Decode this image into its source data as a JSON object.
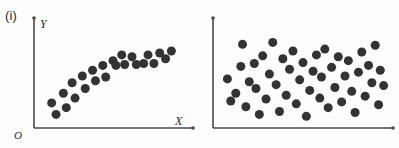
{
  "figure": {
    "background_color": "#fdfdfd",
    "dot_color": "#333333",
    "axis_color": "#4a4a4a"
  },
  "panels": [
    {
      "id": "i",
      "label": "(i)",
      "y_axis_label": "Y",
      "x_axis_label": "X",
      "origin_label": "O"
    },
    {
      "id": "ii",
      "label": "(ii)",
      "y_axis_label": "Y",
      "x_axis_label": "X",
      "origin_label": "O"
    }
  ],
  "chart_data": [
    {
      "type": "scatter",
      "title": "(i)",
      "xlabel": "X",
      "ylabel": "Y",
      "origin_label": "O",
      "grid": false,
      "legend": false,
      "xlim": [
        0,
        100
      ],
      "ylim": [
        0,
        100
      ],
      "description": "Strong positive non-linear (logarithmic) association; points rise steeply then level off",
      "marker": {
        "shape": "circle",
        "color": "#333333",
        "size": 9
      },
      "points": [
        {
          "x": 8,
          "y": 22
        },
        {
          "x": 11,
          "y": 10
        },
        {
          "x": 16,
          "y": 32
        },
        {
          "x": 18,
          "y": 17
        },
        {
          "x": 22,
          "y": 43
        },
        {
          "x": 24,
          "y": 27
        },
        {
          "x": 29,
          "y": 50
        },
        {
          "x": 31,
          "y": 37
        },
        {
          "x": 36,
          "y": 56
        },
        {
          "x": 38,
          "y": 45
        },
        {
          "x": 43,
          "y": 61
        },
        {
          "x": 45,
          "y": 49
        },
        {
          "x": 50,
          "y": 66
        },
        {
          "x": 52,
          "y": 61
        },
        {
          "x": 56,
          "y": 72
        },
        {
          "x": 58,
          "y": 62
        },
        {
          "x": 63,
          "y": 70
        },
        {
          "x": 66,
          "y": 62
        },
        {
          "x": 71,
          "y": 63
        },
        {
          "x": 74,
          "y": 72
        },
        {
          "x": 78,
          "y": 63
        },
        {
          "x": 82,
          "y": 74
        },
        {
          "x": 86,
          "y": 68
        },
        {
          "x": 90,
          "y": 76
        }
      ]
    },
    {
      "type": "scatter",
      "title": "(ii)",
      "xlabel": "X",
      "ylabel": "Y",
      "origin_label": "O",
      "grid": false,
      "legend": false,
      "xlim": [
        0,
        100
      ],
      "ylim": [
        0,
        100
      ],
      "description": "No association; points scattered randomly with no discernible trend",
      "marker": {
        "shape": "circle",
        "color": "#333333",
        "size": 9
      },
      "points": [
        {
          "x": 5,
          "y": 47
        },
        {
          "x": 7,
          "y": 24
        },
        {
          "x": 10,
          "y": 32
        },
        {
          "x": 13,
          "y": 60
        },
        {
          "x": 14,
          "y": 83
        },
        {
          "x": 16,
          "y": 18
        },
        {
          "x": 18,
          "y": 44
        },
        {
          "x": 21,
          "y": 63
        },
        {
          "x": 22,
          "y": 37
        },
        {
          "x": 24,
          "y": 10
        },
        {
          "x": 26,
          "y": 71
        },
        {
          "x": 28,
          "y": 26
        },
        {
          "x": 30,
          "y": 52
        },
        {
          "x": 32,
          "y": 85
        },
        {
          "x": 34,
          "y": 41
        },
        {
          "x": 36,
          "y": 13
        },
        {
          "x": 38,
          "y": 68
        },
        {
          "x": 40,
          "y": 30
        },
        {
          "x": 42,
          "y": 57
        },
        {
          "x": 44,
          "y": 76
        },
        {
          "x": 46,
          "y": 21
        },
        {
          "x": 48,
          "y": 46
        },
        {
          "x": 50,
          "y": 64
        },
        {
          "x": 52,
          "y": 8
        },
        {
          "x": 54,
          "y": 35
        },
        {
          "x": 56,
          "y": 55
        },
        {
          "x": 58,
          "y": 72
        },
        {
          "x": 60,
          "y": 27
        },
        {
          "x": 61,
          "y": 49
        },
        {
          "x": 63,
          "y": 78
        },
        {
          "x": 65,
          "y": 17
        },
        {
          "x": 67,
          "y": 59
        },
        {
          "x": 69,
          "y": 38
        },
        {
          "x": 71,
          "y": 70
        },
        {
          "x": 73,
          "y": 23
        },
        {
          "x": 75,
          "y": 50
        },
        {
          "x": 77,
          "y": 66
        },
        {
          "x": 79,
          "y": 34
        },
        {
          "x": 81,
          "y": 12
        },
        {
          "x": 83,
          "y": 54
        },
        {
          "x": 85,
          "y": 75
        },
        {
          "x": 87,
          "y": 29
        },
        {
          "x": 89,
          "y": 61
        },
        {
          "x": 91,
          "y": 43
        },
        {
          "x": 93,
          "y": 82
        },
        {
          "x": 95,
          "y": 20
        },
        {
          "x": 96,
          "y": 56
        },
        {
          "x": 98,
          "y": 40
        }
      ]
    }
  ]
}
